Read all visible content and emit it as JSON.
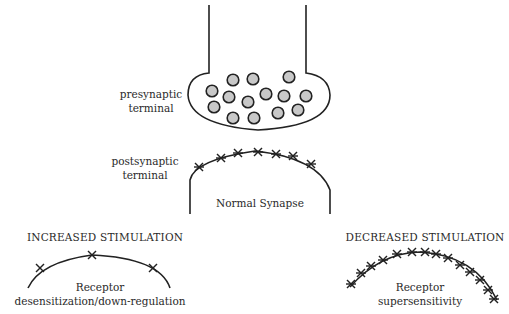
{
  "labels": {
    "presynaptic": [
      "presynaptic",
      "terminal"
    ],
    "postsynaptic": [
      "postsynaptic",
      "terminal"
    ],
    "normal": "Normal Synapse",
    "increased_title": "INCREASED STIMULATION",
    "increased_caption": [
      "Receptor",
      "desensitization/down-regulation"
    ],
    "decreased_title": "DECREASED STIMULATION",
    "decreased_caption": [
      "Receptor",
      "supersensitivity"
    ]
  },
  "colors": {
    "line": "#222222",
    "vesicle_fill": "#c8c8c8",
    "background": "#ffffff"
  },
  "vesicles": [
    [
      233,
      80
    ],
    [
      253,
      79
    ],
    [
      289,
      77
    ],
    [
      212,
      91
    ],
    [
      229,
      97
    ],
    [
      266,
      94
    ],
    [
      284,
      96
    ],
    [
      306,
      96
    ],
    [
      248,
      102
    ],
    [
      214,
      107
    ],
    [
      233,
      118
    ],
    [
      254,
      118
    ],
    [
      278,
      113
    ],
    [
      298,
      110
    ]
  ],
  "receptors": {
    "normal": [
      [
        199,
        167
      ],
      [
        221,
        158
      ],
      [
        238,
        153
      ],
      [
        258,
        152
      ],
      [
        276,
        154
      ],
      [
        293,
        156
      ],
      [
        311,
        164
      ]
    ],
    "increased": [
      [
        40,
        268
      ],
      [
        92,
        255
      ],
      [
        153,
        268
      ]
    ],
    "decreased": [
      [
        351,
        284
      ],
      [
        361,
        273
      ],
      [
        371,
        266
      ],
      [
        383,
        260
      ],
      [
        397,
        254
      ],
      [
        412,
        252
      ],
      [
        425,
        252
      ],
      [
        436,
        254
      ],
      [
        448,
        258
      ],
      [
        460,
        265
      ],
      [
        470,
        272
      ],
      [
        480,
        280
      ],
      [
        488,
        290
      ],
      [
        494,
        299
      ]
    ]
  }
}
